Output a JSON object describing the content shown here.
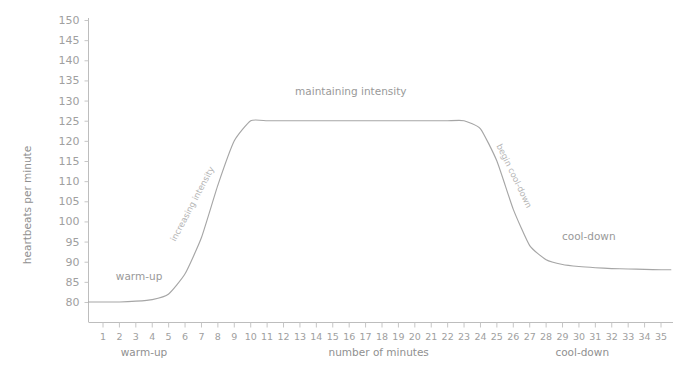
{
  "chart_data": {
    "type": "line",
    "title": "",
    "xlabel": "number of minutes",
    "ylabel": "heartbeats per minute",
    "xlim": [
      0,
      36
    ],
    "ylim": [
      77,
      152
    ],
    "grid": false,
    "legend": "none",
    "x_tick_labels": [
      "1",
      "2",
      "3",
      "4",
      "5",
      "6",
      "7",
      "8",
      "9",
      "10",
      "11",
      "12",
      "13",
      "14",
      "15",
      "16",
      "17",
      "18",
      "19",
      "20",
      "21",
      "22",
      "23",
      "24",
      "25",
      "26",
      "27",
      "28",
      "29",
      "30",
      "31",
      "32",
      "33",
      "34",
      "35"
    ],
    "y_tick_labels": [
      "80",
      "85",
      "90",
      "95",
      "100",
      "105",
      "110",
      "115",
      "120",
      "125",
      "130",
      "135",
      "140",
      "145",
      "150"
    ],
    "y_tick_values": [
      80,
      85,
      90,
      95,
      100,
      105,
      110,
      115,
      120,
      125,
      130,
      135,
      140,
      145,
      150
    ],
    "x": [
      1,
      2,
      3,
      4,
      5,
      6,
      7,
      8,
      9,
      10,
      11,
      12,
      13,
      14,
      15,
      16,
      17,
      18,
      19,
      20,
      21,
      22,
      23,
      24,
      25,
      26,
      27,
      28,
      29,
      30,
      31,
      32,
      33,
      34,
      35
    ],
    "values": [
      80,
      80,
      80.2,
      80.6,
      82,
      87,
      96,
      109,
      120,
      125,
      125,
      125,
      125,
      125,
      125,
      125,
      125,
      125,
      125,
      125,
      125,
      125,
      125,
      123,
      115,
      103,
      94,
      90.5,
      89.3,
      88.8,
      88.5,
      88.3,
      88.2,
      88.1,
      88
    ],
    "series": [
      {
        "name": "heart rate",
        "color": "#a6a6a6",
        "values": [
          80,
          80,
          80.2,
          80.6,
          82,
          87,
          96,
          109,
          120,
          125,
          125,
          125,
          125,
          125,
          125,
          125,
          125,
          125,
          125,
          125,
          125,
          125,
          125,
          123,
          115,
          103,
          94,
          90.5,
          89.3,
          88.8,
          88.5,
          88.3,
          88.2,
          88.1,
          88
        ]
      }
    ],
    "annotations": [
      {
        "text": "warm-up",
        "x": 3.2,
        "y": 85.5,
        "rotation": 0
      },
      {
        "text": "increasing intensity",
        "x": 6.6,
        "y": 104,
        "rotation": -62
      },
      {
        "text": "maintaining intensity",
        "x": 16.1,
        "y": 131.5,
        "rotation": 0
      },
      {
        "text": "begin cool-down",
        "x": 25.9,
        "y": 111,
        "rotation": 64
      },
      {
        "text": "cool-down",
        "x": 30.6,
        "y": 95.5,
        "rotation": 0
      }
    ],
    "x_section_labels": [
      {
        "text": "warm-up",
        "x": 3.5
      },
      {
        "text": "number of minutes",
        "x": 17.8
      },
      {
        "text": "cool-down",
        "x": 30.2
      }
    ],
    "colors": {
      "curve": "#a6a6a6",
      "axis": "#bdbdbd",
      "tick": "#c6c6c6",
      "text": "#a0a0a0",
      "background": "#ffffff"
    }
  }
}
